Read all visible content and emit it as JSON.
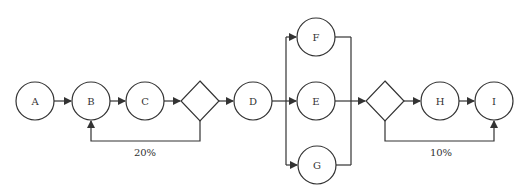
{
  "diagram": {
    "type": "process-flow",
    "nodes": [
      {
        "id": "A",
        "label": "A",
        "shape": "circle",
        "cx": 35,
        "cy": 101
      },
      {
        "id": "B",
        "label": "B",
        "shape": "circle",
        "cx": 91,
        "cy": 101
      },
      {
        "id": "C",
        "label": "C",
        "shape": "circle",
        "cx": 145,
        "cy": 101
      },
      {
        "id": "dec1",
        "label": "",
        "shape": "diamond",
        "cx": 200,
        "cy": 101
      },
      {
        "id": "D",
        "label": "D",
        "shape": "circle",
        "cx": 253,
        "cy": 101
      },
      {
        "id": "F",
        "label": "F",
        "shape": "circle",
        "cx": 316,
        "cy": 37
      },
      {
        "id": "E",
        "label": "E",
        "shape": "circle",
        "cx": 316,
        "cy": 101
      },
      {
        "id": "G",
        "label": "G",
        "shape": "circle",
        "cx": 317,
        "cy": 165
      },
      {
        "id": "dec2",
        "label": "",
        "shape": "diamond",
        "cx": 385,
        "cy": 101
      },
      {
        "id": "H",
        "label": "H",
        "shape": "circle",
        "cx": 440,
        "cy": 101
      },
      {
        "id": "I",
        "label": "I",
        "shape": "circle",
        "cx": 494,
        "cy": 101
      }
    ],
    "edges": [
      {
        "from": "A",
        "to": "B"
      },
      {
        "from": "B",
        "to": "C"
      },
      {
        "from": "C",
        "to": "dec1"
      },
      {
        "from": "dec1",
        "to": "D"
      },
      {
        "from": "dec1",
        "to": "B",
        "label": "20%"
      },
      {
        "from": "D",
        "to": "F"
      },
      {
        "from": "D",
        "to": "E"
      },
      {
        "from": "D",
        "to": "G"
      },
      {
        "from": "F",
        "to": "dec2"
      },
      {
        "from": "E",
        "to": "dec2"
      },
      {
        "from": "G",
        "to": "dec2"
      },
      {
        "from": "dec2",
        "to": "H"
      },
      {
        "from": "H",
        "to": "I"
      },
      {
        "from": "dec2",
        "to": "I",
        "label": "10%"
      }
    ],
    "labels": {
      "A": "A",
      "B": "B",
      "C": "C",
      "D": "D",
      "E": "E",
      "F": "F",
      "G": "G",
      "H": "H",
      "I": "I",
      "loop1": "20%",
      "loop2": "10%"
    },
    "colors": {
      "stroke": "#333333",
      "fill": "#ffffff",
      "text": "#333333"
    }
  }
}
